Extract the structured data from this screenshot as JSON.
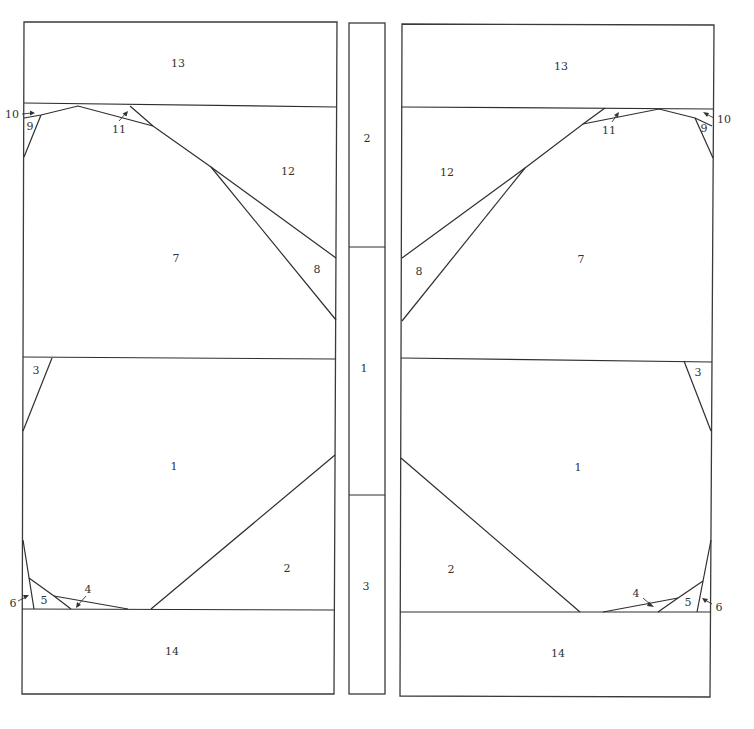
{
  "colors": {
    "line": "#2e2e2e",
    "label": "#333333",
    "background": "#ffffff"
  },
  "left_panel": {
    "labels": {
      "p13": "13",
      "p12": "12",
      "p11": "11",
      "p10": "10",
      "p9": "9",
      "p8": "8",
      "p7": "7",
      "p3": "3",
      "p1": "1",
      "p2": "2",
      "p4": "4",
      "p5": "5",
      "p6": "6",
      "p14": "14"
    }
  },
  "middle_strip": {
    "labels": {
      "s2": "2",
      "s1": "1",
      "s3": "3"
    }
  },
  "right_panel": {
    "labels": {
      "p13": "13",
      "p12": "12",
      "p11": "11",
      "p10": "10",
      "p9": "9",
      "p8": "8",
      "p7": "7",
      "p3": "3",
      "p1": "1",
      "p2": "2",
      "p4": "4",
      "p5": "5",
      "p6": "6",
      "p14": "14"
    }
  }
}
